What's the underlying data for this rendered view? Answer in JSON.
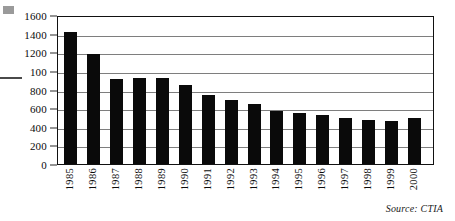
{
  "chart_data": {
    "type": "bar",
    "title": "",
    "xlabel": "",
    "ylabel": "",
    "categories": [
      "1985",
      "1986",
      "1987",
      "1988",
      "1989",
      "1990",
      "1991",
      "1992",
      "1993",
      "1994",
      "1995",
      "1996",
      "1997",
      "1998",
      "1999",
      "2000"
    ],
    "values": [
      1430,
      1200,
      930,
      940,
      945,
      865,
      760,
      705,
      660,
      590,
      565,
      540,
      510,
      485,
      480,
      510
    ],
    "ylim": [
      0,
      1600
    ],
    "ytick_values": [
      0,
      200,
      400,
      600,
      800,
      1000,
      1200,
      1400,
      1600
    ],
    "ytick_labels": [
      "0",
      "200",
      "400",
      "600",
      "800",
      "100",
      "1200",
      "1400",
      "1600"
    ],
    "grid": true,
    "legend": "none",
    "bar_color": "#0a0a0a",
    "gridline_color": "#7e7e7e",
    "frame_color": "#111111",
    "annotations": {
      "source_note": "Source: CTIA",
      "ytick_label_note": "100"
    }
  },
  "figure": {
    "source": "Source: CTIA"
  }
}
